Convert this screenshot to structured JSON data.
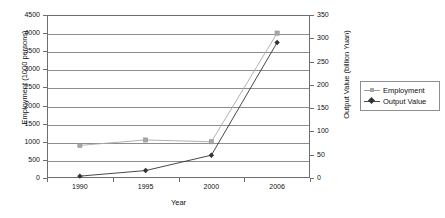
{
  "chart_data": {
    "type": "line",
    "title": "",
    "xlabel": "Year",
    "categories": [
      "1990",
      "1995",
      "2000",
      "2006"
    ],
    "grid": true,
    "legend_position": "right",
    "axes": {
      "left": {
        "label": "Employment (1000 persons)",
        "ticks": [
          "0",
          "500",
          "1000",
          "1500",
          "2000",
          "2500",
          "3000",
          "3500",
          "4000",
          "4500"
        ],
        "min": 0,
        "max": 4500,
        "step": 500
      },
      "right": {
        "label": "Output Value (billion Yuan)",
        "ticks": [
          "0",
          "50",
          "100",
          "150",
          "200",
          "250",
          "300",
          "350"
        ],
        "min": 0,
        "max": 350,
        "step": 50
      }
    },
    "series": [
      {
        "name": "Employment",
        "axis": "left",
        "marker": "square",
        "color": "#a8a8a8",
        "values": [
          900,
          1050,
          1000,
          4000
        ]
      },
      {
        "name": "Output Value",
        "axis": "right",
        "marker": "diamond",
        "color": "#333333",
        "values": [
          4,
          16,
          49,
          291
        ]
      }
    ]
  },
  "legend": {
    "items": [
      {
        "label": "Employment"
      },
      {
        "label": "Output Value"
      }
    ]
  }
}
